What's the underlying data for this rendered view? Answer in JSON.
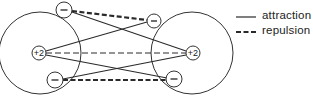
{
  "diagram": {
    "type": "electrostatic interactions between two atoms",
    "atoms": [
      {
        "id": "left",
        "nucleus": {
          "label": "+2",
          "x": 39,
          "y": 53
        },
        "shell": {
          "cx": 40,
          "cy": 53,
          "r": 41
        },
        "electrons": [
          {
            "label": "−",
            "x": 64,
            "y": 10
          },
          {
            "label": "−",
            "x": 55,
            "y": 80
          }
        ]
      },
      {
        "id": "right",
        "nucleus": {
          "label": "+2",
          "x": 193,
          "y": 53
        },
        "shell": {
          "cx": 192,
          "cy": 53,
          "r": 41
        },
        "electrons": [
          {
            "label": "−",
            "x": 154,
            "y": 21
          },
          {
            "label": "−",
            "x": 174,
            "y": 79
          }
        ]
      }
    ],
    "interactions": {
      "attraction": [
        "left-nucleus to right-electron-top",
        "left-nucleus to right-electron-bottom",
        "right-nucleus to left-electron-top",
        "right-nucleus to left-electron-bottom"
      ],
      "repulsion": [
        "left-electron-top to right-electron-top",
        "left-electron-bottom to right-electron-bottom",
        "left-nucleus to right-nucleus"
      ]
    }
  },
  "legend": {
    "items": [
      {
        "label": "attraction",
        "style": "solid"
      },
      {
        "label": "repulsion",
        "style": "dashed"
      }
    ]
  },
  "colors": {
    "ink": "#2a2a2a",
    "background": "#ffffff"
  }
}
